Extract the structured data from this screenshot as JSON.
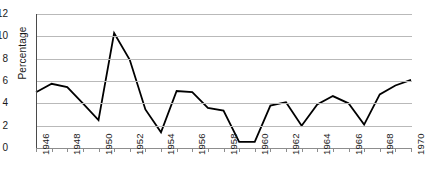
{
  "chart_data": {
    "type": "line",
    "title": "",
    "xlabel": "",
    "ylabel": "Percentage",
    "ylim": [
      0,
      12
    ],
    "ytick_values": [
      0,
      2,
      4,
      6,
      8,
      10,
      12
    ],
    "ytick_labels": [
      "0",
      "2",
      "4",
      "6",
      "8",
      "10",
      "12"
    ],
    "grid": true,
    "grid_axis": "y",
    "legend": false,
    "legend_position": "none",
    "xlim": [
      1946,
      1970
    ],
    "x": [
      1946,
      1947,
      1948,
      1949,
      1950,
      1951,
      1952,
      1953,
      1954,
      1955,
      1956,
      1957,
      1958,
      1959,
      1960,
      1961,
      1962,
      1963,
      1964,
      1965,
      1966,
      1967,
      1968,
      1969,
      1970
    ],
    "xtick_labels": [
      "1946",
      "1947",
      "1948",
      "1949",
      "1950",
      "1951",
      "1952",
      "1953",
      "1954",
      "1955",
      "1956",
      "1957",
      "1958",
      "1959",
      "1960",
      "1961",
      "1962",
      "1963",
      "1964",
      "1965",
      "1966",
      "1967",
      "1968",
      "1969",
      "1970"
    ],
    "xtick_labels_shown": [
      "1946",
      "1948",
      "1950",
      "1952",
      "1954",
      "1956",
      "1958",
      "1960",
      "1962",
      "1964",
      "1966",
      "1968",
      "1970"
    ],
    "xtick_label_rotation": -90,
    "values": [
      5.0,
      5.75,
      5.45,
      4.0,
      2.5,
      10.3,
      7.9,
      3.45,
      1.4,
      5.1,
      5.0,
      3.6,
      3.35,
      0.55,
      0.55,
      3.8,
      4.1,
      2.0,
      3.9,
      4.65,
      4.0,
      2.1,
      4.8,
      5.6,
      6.1
    ],
    "series": [
      {
        "name": "Percentage",
        "color": "#000000",
        "values": [
          5.0,
          5.75,
          5.45,
          4.0,
          2.5,
          10.3,
          7.9,
          3.45,
          1.4,
          5.1,
          5.0,
          3.6,
          3.35,
          0.55,
          0.55,
          3.8,
          4.1,
          2.0,
          3.9,
          4.65,
          4.0,
          2.1,
          4.8,
          5.6,
          6.1
        ]
      }
    ],
    "colors": {
      "series_line": "#000000",
      "gridline": "#b9b9b9",
      "axis": "#4a4a4a",
      "tick_label": "#1a1a1a",
      "background": "#ffffff"
    }
  }
}
